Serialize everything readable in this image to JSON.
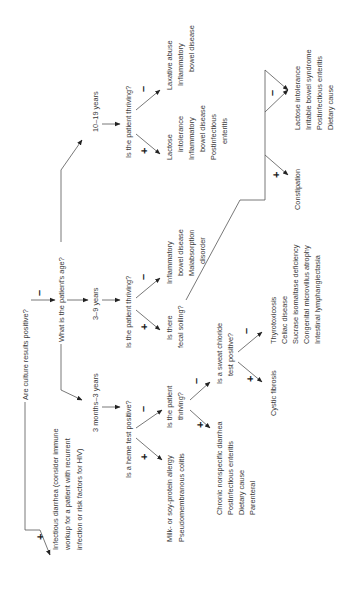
{
  "nodes": {
    "culture": "Are culture results positive?",
    "infectious": [
      "Infectious diarrhea (consider immune",
      "workup for a patient with recurrent",
      "infection or risk factors for HIV)"
    ],
    "age": "What is the patient's age?",
    "age_infant": "3 months–3 years",
    "age_child": "3–9 years",
    "age_teen": "10–19 years",
    "heme": "Is a heme test positive?",
    "heme_pos": [
      "Milk- or soy-protein allergy",
      "Pseudomembranous colitis"
    ],
    "infant_thriving": [
      "Is the patient",
      "thriving?"
    ],
    "infant_thriving_pos": [
      "Chronic nonspecific diarrhea",
      "Postinfectious enteritis",
      "Dietary cause",
      "Parenteral"
    ],
    "sweat": [
      "Is a sweat chloride",
      "test positive?"
    ],
    "sweat_pos": "Cystic fibrosis",
    "sweat_neg": [
      "Thyrotoxicosis",
      "Celiac disease",
      "Sucrase isomaltase deficiency",
      "Congenital microvillus atrophy",
      "Intestinal lymphangiectasia"
    ],
    "child_thriving": "Is the patient thriving?",
    "child_thriving_neg": [
      "Inflammatory",
      "bowel disease",
      "Malabsorption",
      "disorder"
    ],
    "soiling": [
      "Is there",
      "fecal soiling?"
    ],
    "soiling_pos": "Constipation",
    "soiling_neg": [
      "Lactose intolerance",
      "Irritable bowel syndrome",
      "Postinfectious enteritis",
      "Dietary cause"
    ],
    "teen_thriving": "Is the patient thriving?",
    "teen_thriving_pos": [
      "Lactose",
      "intolerance",
      "Inflammatory",
      "bowel disease",
      "Postinfectious",
      "enteritis"
    ],
    "teen_thriving_neg": [
      "Laxative abuse",
      "Inflammatory",
      "bowel disease"
    ]
  },
  "signs": {
    "plus": "+",
    "minus": "–"
  }
}
